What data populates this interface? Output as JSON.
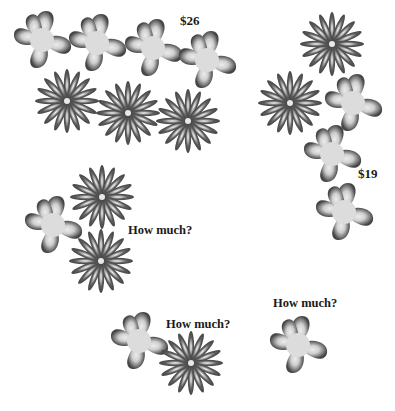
{
  "puzzle": {
    "groups": [
      {
        "id": "group-1",
        "price_label": "$26",
        "items": {
          "five_petal_flowers": 4,
          "daisies": 3
        }
      },
      {
        "id": "group-2",
        "price_label": "$19",
        "items": {
          "five_petal_flowers": 3,
          "daisies": 2
        }
      },
      {
        "id": "group-3",
        "price_label": "How much?",
        "items": {
          "five_petal_flowers": 1,
          "daisies": 2
        }
      },
      {
        "id": "group-4",
        "price_label": "How much?",
        "items": {
          "five_petal_flowers": 1,
          "daisies": 1
        }
      },
      {
        "id": "group-5",
        "price_label": "How much?",
        "items": {
          "five_petal_flowers": 1,
          "daisies": 0
        }
      }
    ]
  },
  "colors": {
    "petal_dark": "#4a4a4a",
    "petal_light": "#e6e6e6",
    "text": "#1a1a1a"
  }
}
